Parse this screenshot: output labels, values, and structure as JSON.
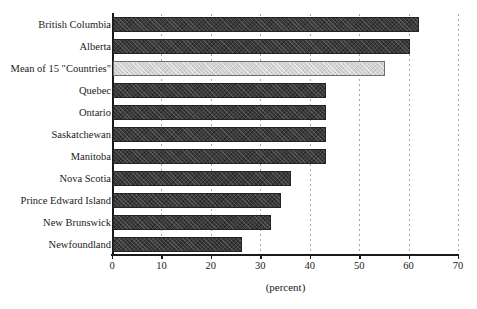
{
  "chart_data": {
    "type": "bar",
    "orientation": "horizontal",
    "title": "",
    "xlabel": "(percent)",
    "ylabel": "",
    "xlim": [
      0,
      70
    ],
    "xticks": [
      0,
      10,
      20,
      30,
      40,
      50,
      60,
      70
    ],
    "xtick_labels": [
      "0",
      "10",
      "20",
      "30",
      "40",
      "50",
      "60",
      "70"
    ],
    "grid": "dashed vertical gridlines at x ticks",
    "legend": "none",
    "categories": [
      "British Columbia",
      "Alberta",
      "Mean of 15 \"Countries\"",
      "Quebec",
      "Ontario",
      "Saskatchewan",
      "Manitoba",
      "Nova Scotia",
      "Prince Edward Island",
      "New Brunswick",
      "Newfoundland"
    ],
    "values": [
      62,
      60,
      55,
      43,
      43,
      43,
      43,
      36,
      34,
      32,
      26
    ],
    "bar_styles": [
      "dark-hatched",
      "dark-hatched",
      "light-hatched",
      "dark-hatched",
      "dark-hatched",
      "dark-hatched",
      "dark-hatched",
      "dark-hatched",
      "dark-hatched",
      "dark-hatched",
      "dark-hatched"
    ],
    "colors": {
      "bar_dark": "#3a3a3a",
      "bar_dark_border": "#242424",
      "bar_light": "#d2d2d2",
      "bar_light_border": "#6e6e6e",
      "axis": "#1a1a1a",
      "gridline": "#9a9a9a",
      "background": "#ffffff"
    }
  }
}
